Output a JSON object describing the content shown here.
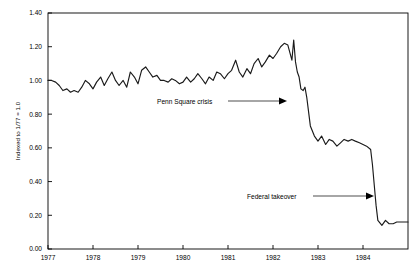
{
  "chart_data": {
    "type": "line",
    "title": "",
    "xlabel": "",
    "ylabel": "Indexed to 1/77 = 1.0",
    "xlim": [
      1977.0,
      1985.0
    ],
    "ylim": [
      0.0,
      1.4
    ],
    "grid": false,
    "legend": "none",
    "x_tick_labels": [
      "1977",
      "1978",
      "1979",
      "1980",
      "1981",
      "1982",
      "1983",
      "1984"
    ],
    "x_ticks": [
      1977,
      1978,
      1979,
      1980,
      1981,
      1982,
      1983,
      1984
    ],
    "y_tick_labels": [
      "0.00",
      "0.20",
      "0.40",
      "0.60",
      "0.80",
      "1.00",
      "1.20",
      "1.40"
    ],
    "y_ticks": [
      0.0,
      0.2,
      0.4,
      0.6,
      0.8,
      1.0,
      1.2,
      1.4
    ],
    "series": [
      {
        "name": "Indexed value",
        "x": [
          1977.0,
          1977.08,
          1977.17,
          1977.25,
          1977.33,
          1977.42,
          1977.5,
          1977.58,
          1977.67,
          1977.75,
          1977.83,
          1977.92,
          1978.0,
          1978.08,
          1978.17,
          1978.25,
          1978.33,
          1978.42,
          1978.5,
          1978.58,
          1978.67,
          1978.75,
          1978.83,
          1978.92,
          1979.0,
          1979.08,
          1979.17,
          1979.25,
          1979.33,
          1979.42,
          1979.5,
          1979.58,
          1979.67,
          1979.75,
          1979.83,
          1979.92,
          1980.0,
          1980.08,
          1980.17,
          1980.25,
          1980.33,
          1980.42,
          1980.5,
          1980.58,
          1980.67,
          1980.75,
          1980.83,
          1980.92,
          1981.0,
          1981.08,
          1981.17,
          1981.25,
          1981.33,
          1981.42,
          1981.5,
          1981.58,
          1981.67,
          1981.75,
          1981.83,
          1981.92,
          1982.0,
          1982.08,
          1982.17,
          1982.25,
          1982.33,
          1982.42,
          1982.46,
          1982.5,
          1982.54,
          1982.58,
          1982.62,
          1982.67,
          1982.71,
          1982.75,
          1982.83,
          1982.92,
          1983.0,
          1983.08,
          1983.17,
          1983.25,
          1983.33,
          1983.42,
          1983.5,
          1983.58,
          1983.67,
          1983.75,
          1983.83,
          1983.92,
          1984.0,
          1984.08,
          1984.17,
          1984.21,
          1984.25,
          1984.29,
          1984.33,
          1984.42,
          1984.5,
          1984.58,
          1984.67,
          1984.75,
          1984.83,
          1984.92,
          1985.0
        ],
        "y": [
          1.0,
          1.0,
          0.99,
          0.97,
          0.94,
          0.95,
          0.93,
          0.94,
          0.93,
          0.96,
          1.0,
          0.98,
          0.95,
          0.99,
          1.02,
          0.97,
          1.01,
          1.05,
          1.0,
          0.97,
          1.0,
          0.96,
          1.05,
          1.02,
          0.98,
          1.06,
          1.08,
          1.05,
          1.02,
          1.03,
          1.0,
          1.0,
          0.99,
          1.01,
          1.0,
          0.98,
          0.99,
          1.02,
          0.99,
          1.01,
          1.04,
          1.01,
          0.98,
          1.02,
          1.0,
          1.05,
          1.04,
          1.01,
          1.04,
          1.06,
          1.12,
          1.05,
          1.02,
          1.07,
          1.04,
          1.1,
          1.13,
          1.08,
          1.11,
          1.15,
          1.13,
          1.16,
          1.2,
          1.22,
          1.21,
          1.12,
          1.24,
          1.11,
          1.05,
          1.02,
          0.95,
          0.94,
          0.96,
          0.9,
          0.73,
          0.67,
          0.64,
          0.67,
          0.62,
          0.65,
          0.64,
          0.61,
          0.63,
          0.65,
          0.64,
          0.65,
          0.64,
          0.63,
          0.62,
          0.61,
          0.59,
          0.5,
          0.38,
          0.26,
          0.17,
          0.14,
          0.17,
          0.15,
          0.15,
          0.16,
          0.16,
          0.16,
          0.16
        ]
      }
    ],
    "annotations": [
      {
        "id": "penn-square-crisis",
        "label": "Penn Square crisis",
        "label_x": 157,
        "label_y": 104,
        "line_from_x": 228,
        "line_to_x": 287,
        "line_y": 101,
        "target_year": 1982.45,
        "target_value": 0.88
      },
      {
        "id": "federal-takeover",
        "label": "Federal takeover",
        "label_x": 247,
        "label_y": 199,
        "line_from_x": 313,
        "line_to_x": 374,
        "line_y": 196,
        "target_year": 1984.22,
        "target_value": 0.44
      }
    ]
  },
  "geometry": {
    "plot_left": 48,
    "plot_right": 408,
    "plot_top": 13,
    "plot_bottom": 249
  }
}
